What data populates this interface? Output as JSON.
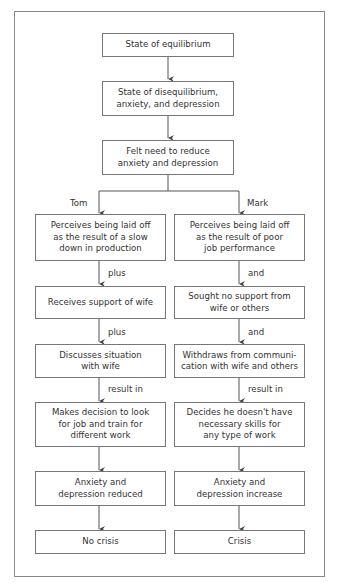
{
  "top": [
    {
      "text": "State of equilibrium"
    },
    {
      "text": "State of disequilibrium,\nanxiety, and depression"
    },
    {
      "text": "Felt need to reduce\nanxiety and depression"
    }
  ],
  "branches": {
    "left": {
      "name": "Tom",
      "boxes": [
        "Perceives being laid off\nas the result of a slow\ndown in production",
        "Receives support of wife",
        "Discusses situation\nwith wife",
        "Makes decision to look\nfor job and train for\ndifferent work",
        "Anxiety and\ndepression reduced",
        "No crisis"
      ],
      "connectors": [
        "plus",
        "plus",
        "result in"
      ]
    },
    "right": {
      "name": "Mark",
      "boxes": [
        "Perceives being laid off\nas the result of poor\njob performance",
        "Sought no support from\nwife or others",
        "Withdraws from communi-\ncation with wife and others",
        "Decides he doesn't have\nnecessary skills for\nany type of work",
        "Anxiety and\ndepression increase",
        "Crisis"
      ],
      "connectors": [
        "and",
        "and",
        "result in"
      ]
    }
  }
}
